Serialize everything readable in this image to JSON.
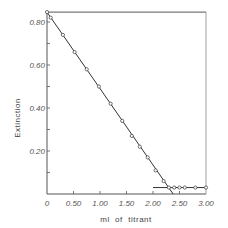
{
  "chart_data": {
    "type": "line",
    "title": "",
    "xlabel": "ml  of  titrant",
    "ylabel": "Extinction",
    "xlim": [
      0,
      3.0
    ],
    "ylim": [
      0,
      0.846
    ],
    "x_ticks": [
      0,
      0.5,
      1.0,
      1.5,
      2.0,
      2.5,
      3.0
    ],
    "x_tick_labels": [
      "0",
      "0.50",
      "1.00",
      "1.50",
      "2.00",
      "2.50",
      "3.00"
    ],
    "y_ticks": [
      0.2,
      0.4,
      0.6,
      0.8
    ],
    "y_tick_labels": [
      "0.20",
      "0.40",
      "0.60",
      "0.80"
    ],
    "grid": false,
    "legend": null,
    "series": [
      {
        "name": "descending branch",
        "x": [
          0,
          0.07,
          0.3,
          0.52,
          0.75,
          0.98,
          1.2,
          1.42,
          1.6,
          1.75,
          1.9,
          2.05,
          2.2,
          2.3
        ],
        "y": [
          0.846,
          0.82,
          0.74,
          0.66,
          0.58,
          0.5,
          0.42,
          0.34,
          0.27,
          0.22,
          0.17,
          0.11,
          0.06,
          0.03
        ]
      },
      {
        "name": "plateau",
        "x": [
          2.4,
          2.5,
          2.6,
          2.8,
          3.0
        ],
        "y": [
          0.03,
          0.03,
          0.03,
          0.03,
          0.03
        ]
      }
    ],
    "fit_lines": [
      {
        "name": "descending fit",
        "x": [
          0,
          2.38
        ],
        "y": [
          0.846,
          0.0
        ]
      },
      {
        "name": "plateau fit",
        "x": [
          2.0,
          3.0
        ],
        "y": [
          0.03,
          0.03
        ]
      },
      {
        "name": "initial level",
        "x": [
          0,
          3.0
        ],
        "y": [
          0.846,
          0.846
        ]
      }
    ],
    "annotations": [
      "Endpoint near 2.36 ml"
    ]
  },
  "colors": {
    "line": "#333333",
    "axis": "#555555",
    "marker_fill": "#ffffff"
  }
}
